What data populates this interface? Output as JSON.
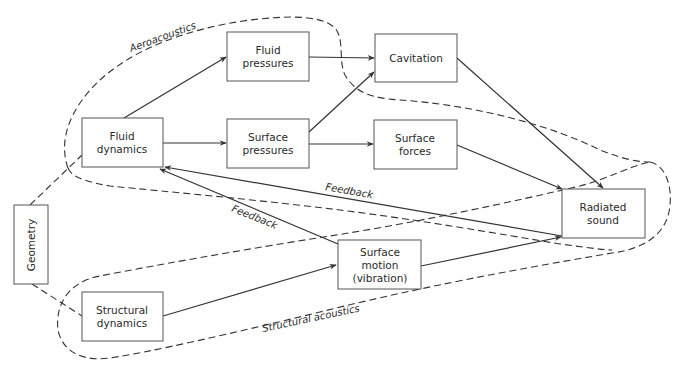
{
  "diagram": {
    "nodes": {
      "fluid_pressures": {
        "line1": "Fluid",
        "line2": "pressures"
      },
      "cavitation": {
        "line1": "Cavitation"
      },
      "fluid_dynamics": {
        "line1": "Fluid",
        "line2": "dynamics"
      },
      "surface_pressures": {
        "line1": "Surface",
        "line2": "pressures"
      },
      "surface_forces": {
        "line1": "Surface",
        "line2": "forces"
      },
      "radiated_sound": {
        "line1": "Radiated",
        "line2": "sound"
      },
      "geometry": {
        "line1": "Geometry"
      },
      "surface_motion": {
        "line1": "Surface",
        "line2": "motion",
        "line3": "(vibration)"
      },
      "structural_dynamics": {
        "line1": "Structural",
        "line2": "dynamics"
      }
    },
    "region_labels": {
      "aeroacoustics": "Aeroacoustics",
      "structural_acoustics": "Structural acoustics"
    },
    "edge_labels": {
      "feedback_upper": "Feedback",
      "feedback_lower": "Feedback"
    },
    "edges": [
      {
        "from": "Fluid dynamics",
        "to": "Fluid pressures"
      },
      {
        "from": "Fluid dynamics",
        "to": "Surface pressures"
      },
      {
        "from": "Fluid pressures",
        "to": "Cavitation"
      },
      {
        "from": "Surface pressures",
        "to": "Cavitation"
      },
      {
        "from": "Surface pressures",
        "to": "Surface forces"
      },
      {
        "from": "Cavitation",
        "to": "Radiated sound"
      },
      {
        "from": "Surface forces",
        "to": "Radiated sound"
      },
      {
        "from": "Radiated sound",
        "to": "Fluid dynamics",
        "label": "Feedback"
      },
      {
        "from": "Surface motion (vibration)",
        "to": "Fluid dynamics",
        "label": "Feedback"
      },
      {
        "from": "Structural dynamics",
        "to": "Surface motion (vibration)"
      },
      {
        "from": "Surface motion (vibration)",
        "to": "Radiated sound"
      },
      {
        "from": "Geometry",
        "to": "Fluid dynamics",
        "style": "dashed"
      },
      {
        "from": "Geometry",
        "to": "Structural dynamics",
        "style": "dashed"
      }
    ]
  }
}
